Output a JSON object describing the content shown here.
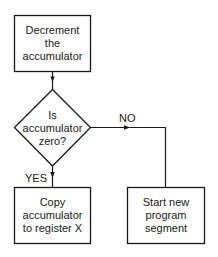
{
  "flowchart": {
    "nodes": [
      {
        "id": "decrement",
        "shape": "rectangle",
        "lines": [
          "Decrement",
          "the",
          "accumulator"
        ]
      },
      {
        "id": "decision",
        "shape": "diamond",
        "lines": [
          "Is",
          "accumulator",
          "zero?"
        ]
      },
      {
        "id": "copy",
        "shape": "rectangle",
        "lines": [
          "Copy",
          "accumulator",
          "to register X"
        ]
      },
      {
        "id": "start_new",
        "shape": "rectangle",
        "lines": [
          "Start new",
          "program",
          "segment"
        ]
      }
    ],
    "edges": [
      {
        "from": "decrement",
        "to": "decision",
        "label": ""
      },
      {
        "from": "decision",
        "to": "copy",
        "label": "YES"
      },
      {
        "from": "decision",
        "to": "start_new",
        "label": "NO"
      }
    ],
    "labels": {
      "yes": "YES",
      "no": "NO"
    }
  },
  "colors": {
    "stroke": "#1a1a1a",
    "background": "#ffffff"
  }
}
